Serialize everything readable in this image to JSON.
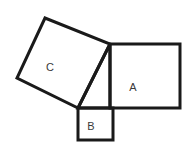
{
  "figure": {
    "background_color": "#ffffff",
    "stroke_color": "#1a1a1a",
    "fill_color": "#ffffff",
    "label_color": "#3a3a3a",
    "width": 191,
    "height": 151
  },
  "shapes": [
    {
      "id": "square-c",
      "label": "C",
      "role": "square-on-hypotenuse",
      "orientation": "tilted",
      "stroke_width": 3,
      "points": "78,108 110,44 45,18 17,78",
      "label_x": 50,
      "label_y": 68
    },
    {
      "id": "square-a",
      "label": "A",
      "role": "square-on-vertical-leg",
      "orientation": "axis-aligned",
      "stroke_width": 3,
      "points": "110,44 180,44 180,108 110,108",
      "label_x": 133,
      "label_y": 88
    },
    {
      "id": "square-b",
      "label": "B",
      "role": "square-on-horizontal-leg",
      "orientation": "axis-aligned",
      "stroke_width": 3,
      "points": "78,108 113,108 113,140 78,140",
      "label_x": 91,
      "label_y": 127
    }
  ],
  "triangle": {
    "id": "right-triangle",
    "vertices": "78,108 110,44 110,108",
    "hypotenuse": "78,108 110,44",
    "vertical_leg": "110,44 110,108",
    "horizontal_leg": "78,108 110,108",
    "stroke_width": 3
  }
}
